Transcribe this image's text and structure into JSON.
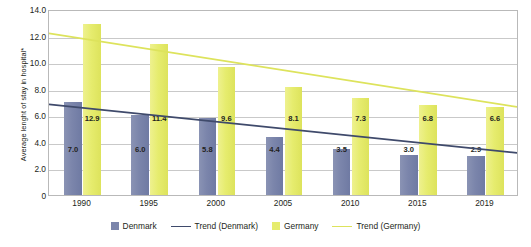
{
  "chart_data": {
    "type": "bar",
    "title": "",
    "subtitle": "",
    "xlabel": "",
    "ylabel": "Average lenght of stay in hospital*",
    "categories": [
      "1990",
      "1995",
      "2000",
      "2005",
      "2010",
      "2015",
      "2019"
    ],
    "ylim": [
      0,
      14
    ],
    "ytick_labels": [
      "0",
      "2.0",
      "4.0",
      "6.0",
      "8.0",
      "10.0",
      "12.0",
      "14.0"
    ],
    "ytick_values": [
      0,
      2,
      4,
      6,
      8,
      10,
      12,
      14
    ],
    "grid": true,
    "legend_position": "bottom",
    "series": [
      {
        "name": "Denmark",
        "kind": "bar",
        "color": "#7b85ab",
        "values": [
          7.0,
          6.0,
          5.8,
          4.4,
          3.5,
          3.0,
          2.9
        ],
        "labels": [
          "7.0",
          "6.0",
          "5.8",
          "4.4",
          "3.5",
          "3.0",
          "2.9"
        ]
      },
      {
        "name": "Germany",
        "kind": "bar",
        "color": "#e6ec6e",
        "values": [
          12.9,
          11.4,
          9.6,
          8.1,
          7.3,
          6.8,
          6.6
        ],
        "labels": [
          "12.9",
          "11.4",
          "9.6",
          "8.1",
          "7.3",
          "6.8",
          "6.6"
        ]
      },
      {
        "name": "Trend (Denmark)",
        "kind": "line",
        "color": "#3f4a6b",
        "endpoints": [
          6.9,
          3.2
        ]
      },
      {
        "name": "Trend (Germany)",
        "kind": "line",
        "color": "#dde35c",
        "endpoints": [
          12.3,
          6.7
        ]
      }
    ],
    "legend": [
      {
        "label": "Denmark",
        "marker": "box",
        "color": "#7b85ab"
      },
      {
        "label": "Trend (Denmark)",
        "marker": "line",
        "color": "#3f4a6b"
      },
      {
        "label": "Germany",
        "marker": "box",
        "color": "#e6ec6e"
      },
      {
        "label": "Trend (Germany)",
        "marker": "line",
        "color": "#dde35c"
      }
    ]
  }
}
